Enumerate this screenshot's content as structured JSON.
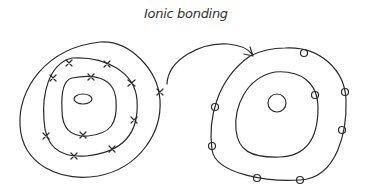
{
  "title": "Ionic bonding",
  "colors": {
    "ink": "#2b2b2b",
    "background": "#ffffff"
  },
  "left_atom": {
    "label": "atom before electron transfer",
    "shells": 3,
    "electron_marker": "x",
    "electrons_outer_shell": 1,
    "electrons_middle_shell": 8,
    "electrons_inner_shell": 2
  },
  "right_atom": {
    "label": "ion after electron transfer",
    "shells": 2,
    "electron_marker": "o",
    "electrons_outer_shell": 8,
    "electrons_inner_shell": 0
  },
  "arrow": {
    "label": "electron transfer arrow",
    "from": "left_atom",
    "to": "right_atom"
  }
}
